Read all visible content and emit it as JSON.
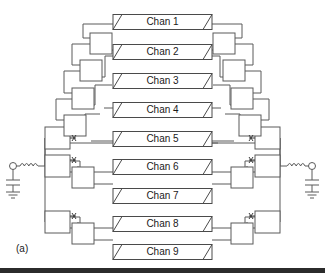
{
  "figure": {
    "caption": "(a)",
    "background_color": "#ffffff",
    "line_color": "#5a5a5a",
    "text_color": "#1a1a1a",
    "footer_bar_color": "#2b2b2b"
  },
  "channels": [
    {
      "label": "Chan 1",
      "row": 1,
      "y": 22
    },
    {
      "label": "Chan 2",
      "row": 2,
      "y": 52
    },
    {
      "label": "Chan 3",
      "row": 3,
      "y": 81
    },
    {
      "label": "Chan 4",
      "row": 4,
      "y": 110
    },
    {
      "label": "Chan 5",
      "row": 5,
      "y": 139
    },
    {
      "label": "Chan 6",
      "row": 6,
      "y": 167
    },
    {
      "label": "Chan 7",
      "row": 7,
      "y": 196
    },
    {
      "label": "Chan 8",
      "row": 8,
      "y": 224
    },
    {
      "label": "Chan 9",
      "row": 9,
      "y": 252
    }
  ],
  "terminations": {
    "left": {
      "port_symbol": "circle-port",
      "series_element": "inductor-coil",
      "shunt_element": "capacitor",
      "reference": "ground"
    },
    "right": {
      "port_symbol": "circle-port",
      "series_element": "inductor-coil",
      "shunt_element": "capacitor",
      "reference": "ground"
    }
  },
  "junction_boxes": {
    "count_left": 9,
    "count_right": 9,
    "marker_symbol": "x-marker",
    "description": "binary splitter / combiner nodes"
  },
  "chart_data": {
    "type": "diagram",
    "categories": [
      "Chan 1",
      "Chan 2",
      "Chan 3",
      "Chan 4",
      "Chan 5",
      "Chan 6",
      "Chan 7",
      "Chan 8",
      "Chan 9"
    ],
    "values": [
      1,
      2,
      3,
      4,
      5,
      6,
      7,
      8,
      9
    ]
  }
}
